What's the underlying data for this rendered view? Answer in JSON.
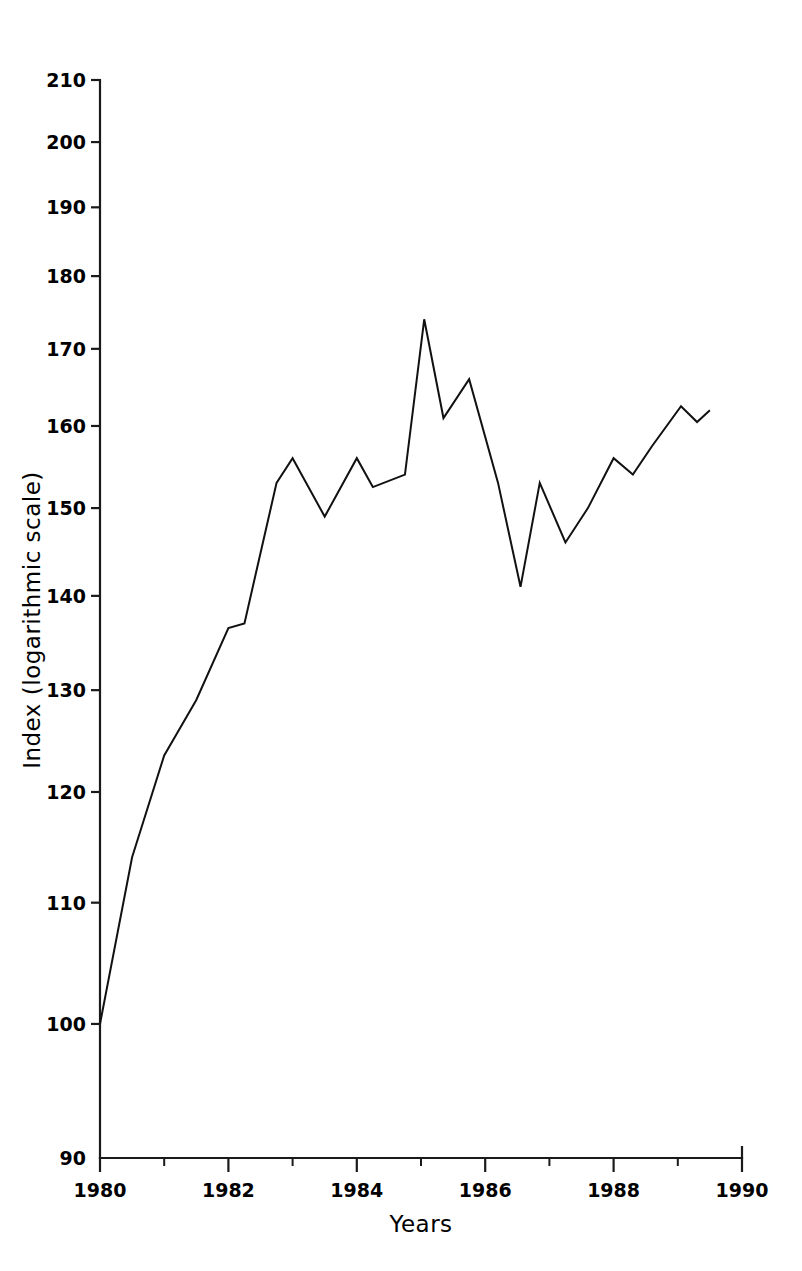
{
  "chart_data": {
    "type": "line",
    "title": "",
    "subtitle": "",
    "xlabel": "Years",
    "ylabel": "Index (logarithmic scale)",
    "yscale": "log",
    "xscale": "linear",
    "xlim": [
      1980,
      1990
    ],
    "ylim": [
      90,
      210
    ],
    "grid": false,
    "legend": null,
    "line_color": "#111111",
    "x_tick_labels": [
      "1980",
      "1982",
      "1984",
      "1986",
      "1988",
      "1990"
    ],
    "x_tick_values": [
      1980,
      1982,
      1984,
      1986,
      1988,
      1990
    ],
    "x_minor_tick_values": [
      1981,
      1983,
      1985,
      1987,
      1989
    ],
    "y_tick_labels": [
      "90",
      "100",
      "110",
      "120",
      "130",
      "140",
      "150",
      "160",
      "170",
      "180",
      "190",
      "200",
      "210"
    ],
    "y_tick_values": [
      90,
      100,
      110,
      120,
      130,
      140,
      150,
      160,
      170,
      180,
      190,
      200,
      210
    ],
    "x": [
      1980.0,
      1980.5,
      1981.0,
      1981.5,
      1982.0,
      1982.5,
      1983.0,
      1983.5,
      1984.0,
      1984.5,
      1985.0,
      1985.5,
      1986.0,
      1986.5,
      1987.0,
      1987.5,
      1988.0,
      1988.5,
      1989.0,
      1989.5
    ],
    "series": [
      {
        "name": "Index",
        "x": [
          1980.0,
          1980.5,
          1981.0,
          1981.5,
          1982.0,
          1982.25,
          1982.75,
          1983.0,
          1983.5,
          1984.0,
          1984.25,
          1984.75,
          1985.05,
          1985.35,
          1985.75,
          1986.2,
          1986.55,
          1986.85,
          1987.25,
          1987.6,
          1988.0,
          1988.3,
          1988.6,
          1989.05,
          1989.3,
          1989.5
        ],
        "values": [
          100,
          114,
          123.5,
          129,
          136.5,
          137,
          153,
          156,
          149,
          156,
          152.5,
          154,
          174,
          161,
          166,
          153,
          141,
          153,
          146,
          150,
          156,
          154,
          157.5,
          162.5,
          160.5,
          162
        ]
      }
    ],
    "annotations": []
  },
  "figure": {
    "background_color": "#ffffff",
    "axis_color": "#1a1a1a"
  }
}
